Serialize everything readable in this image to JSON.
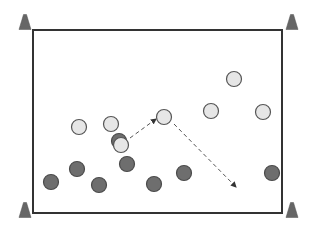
{
  "diagram": {
    "type": "sports-drill",
    "colors": {
      "field_border": "#333333",
      "cone": "#666666",
      "light_player_fill": "#e6e6e6",
      "light_player_stroke": "#555555",
      "dark_player_fill": "#6e6e6e",
      "dark_player_stroke": "#4a4a4a",
      "arrow": "#555555"
    },
    "field": {
      "x": 33,
      "y": 30,
      "width": 249,
      "height": 183
    },
    "cones": [
      {
        "name": "cone-top-left",
        "x": 25,
        "y": 22
      },
      {
        "name": "cone-top-right",
        "x": 292,
        "y": 22
      },
      {
        "name": "cone-bottom-left",
        "x": 25,
        "y": 210
      },
      {
        "name": "cone-bottom-right",
        "x": 292,
        "y": 210
      }
    ],
    "light_players": [
      {
        "x": 79,
        "y": 127
      },
      {
        "x": 111,
        "y": 124
      },
      {
        "x": 164,
        "y": 117
      },
      {
        "x": 211,
        "y": 111
      },
      {
        "x": 234,
        "y": 79
      },
      {
        "x": 263,
        "y": 112
      }
    ],
    "dark_players": [
      {
        "x": 51,
        "y": 182
      },
      {
        "x": 77,
        "y": 169
      },
      {
        "x": 99,
        "y": 185
      },
      {
        "x": 127,
        "y": 164
      },
      {
        "x": 154,
        "y": 184
      },
      {
        "x": 184,
        "y": 173
      },
      {
        "x": 272,
        "y": 173
      }
    ],
    "ball_carrier": {
      "dark_behind": {
        "x": 119,
        "y": 141
      },
      "light_front": {
        "x": 121,
        "y": 145
      }
    },
    "arrows": [
      {
        "name": "pass-arrow",
        "x1": 130,
        "y1": 138,
        "x2": 156,
        "y2": 119
      },
      {
        "name": "run-arrow",
        "x1": 174,
        "y1": 124,
        "x2": 236,
        "y2": 187
      }
    ]
  }
}
